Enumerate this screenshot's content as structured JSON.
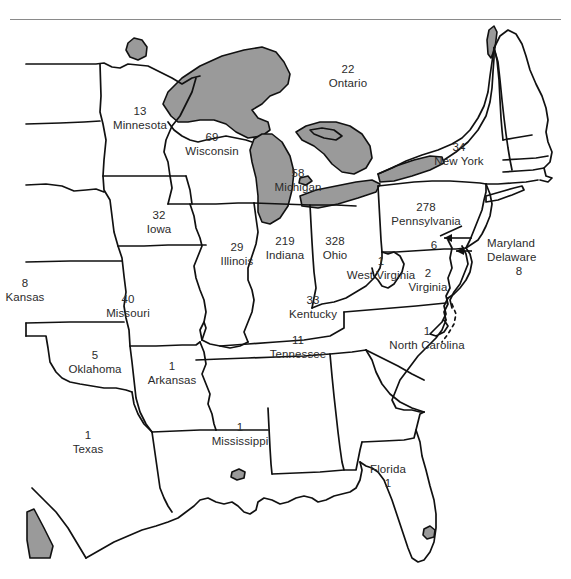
{
  "figure": {
    "type": "choropleth-count-map",
    "region_description": "Eastern and central United States with southern Ontario",
    "divider_rule_color": "#8a8a8a",
    "water_fill_color": "#9a9a9a",
    "land_fill_color": "#ffffff",
    "border_color": "#111111"
  },
  "chart_data": {
    "type": "map",
    "title": "",
    "regions": [
      {
        "name": "Ontario",
        "value": "22",
        "x": 348,
        "y": 62,
        "layout": "count-above"
      },
      {
        "name": "Minnesota",
        "value": "13",
        "x": 140,
        "y": 104,
        "layout": "count-above"
      },
      {
        "name": "Wisconsin",
        "value": "69",
        "x": 212,
        "y": 130,
        "layout": "count-above"
      },
      {
        "name": "Michigan",
        "value": "58",
        "x": 298,
        "y": 166,
        "layout": "count-above"
      },
      {
        "name": "New York",
        "value": "34",
        "x": 459,
        "y": 140,
        "layout": "count-above"
      },
      {
        "name": "Iowa",
        "value": "32",
        "x": 159,
        "y": 208,
        "layout": "count-above"
      },
      {
        "name": "Pennsylvania",
        "value": "278",
        "x": 426,
        "y": 200,
        "layout": "count-above"
      },
      {
        "name": "Illinois",
        "value": "29",
        "x": 237,
        "y": 240,
        "layout": "count-above"
      },
      {
        "name": "Indiana",
        "value": "219",
        "x": 285,
        "y": 234,
        "layout": "count-above"
      },
      {
        "name": "Ohio",
        "value": "328",
        "x": 335,
        "y": 234,
        "layout": "count-above"
      },
      {
        "name": "Kansas",
        "value": "8",
        "x": 25,
        "y": 276,
        "layout": "count-above"
      },
      {
        "name": "Missouri",
        "value": "40",
        "x": 128,
        "y": 292,
        "layout": "count-above"
      },
      {
        "name": "West Virginia",
        "value": "1",
        "x": 381,
        "y": 254,
        "layout": "count-above"
      },
      {
        "name": "Virginia",
        "value": "2",
        "x": 428,
        "y": 266,
        "layout": "count-above"
      },
      {
        "name": "Kentucky",
        "value": "33",
        "x": 313,
        "y": 293,
        "layout": "count-above"
      },
      {
        "name": "Tennessee",
        "value": "11",
        "x": 298,
        "y": 333,
        "layout": "count-above"
      },
      {
        "name": "North Carolina",
        "value": "1",
        "x": 427,
        "y": 324,
        "layout": "count-above"
      },
      {
        "name": "Oklahoma",
        "value": "5",
        "x": 95,
        "y": 348,
        "layout": "count-above"
      },
      {
        "name": "Arkansas",
        "value": "1",
        "x": 172,
        "y": 359,
        "layout": "count-above"
      },
      {
        "name": "Texas",
        "value": "1",
        "x": 88,
        "y": 428,
        "layout": "count-above"
      },
      {
        "name": "Mississippi",
        "value": "1",
        "x": 240,
        "y": 420,
        "layout": "count-above"
      },
      {
        "name": "Florida",
        "value": "1",
        "x": 388,
        "y": 462,
        "layout": "count-below"
      }
    ],
    "callouts": [
      {
        "name": "Maryland",
        "value": "6",
        "label_x": 487,
        "label_y": 236,
        "value_x": 434,
        "value_y": 238
      },
      {
        "name": "Delaware",
        "value": "8",
        "label_x": 487,
        "label_y": 250,
        "value_x": 519,
        "value_y": 264
      }
    ]
  }
}
